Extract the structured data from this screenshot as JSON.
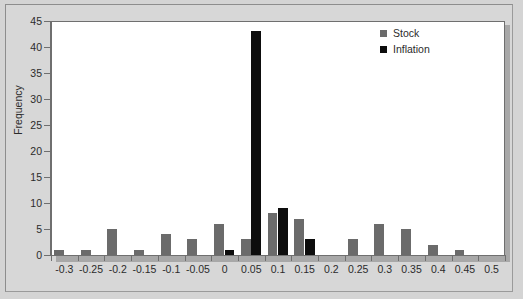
{
  "chart_data": {
    "type": "bar",
    "title": "",
    "xlabel": "",
    "ylabel": "Frequency",
    "ylim": [
      0,
      45
    ],
    "ytick_step": 5,
    "yticks": [
      0,
      5,
      10,
      15,
      20,
      25,
      30,
      35,
      40,
      45
    ],
    "grid": false,
    "legend_position": "top-right",
    "categories": [
      "-0.3",
      "-0.25",
      "-0.2",
      "-0.15",
      "-0.1",
      "-0.05",
      "0",
      "0.05",
      "0.1",
      "0.15",
      "0.2",
      "0.25",
      "0.3",
      "0.35",
      "0.4",
      "0.45",
      "0.5"
    ],
    "series": [
      {
        "name": "Stock",
        "color": "#6b6b6b",
        "values": [
          1,
          1,
          5,
          1,
          4,
          3,
          6,
          3,
          8,
          7,
          0,
          3,
          6,
          5,
          2,
          1,
          0
        ]
      },
      {
        "name": "Inflation",
        "color": "#0d0d0d",
        "values": [
          0,
          0,
          0,
          0,
          0,
          0,
          1,
          43,
          9,
          3,
          0,
          0,
          0,
          0,
          0,
          0,
          0
        ]
      }
    ]
  },
  "legend": {
    "items": [
      {
        "label": "Stock",
        "swatch": "stock"
      },
      {
        "label": "Inflation",
        "swatch": "inflation"
      }
    ]
  }
}
